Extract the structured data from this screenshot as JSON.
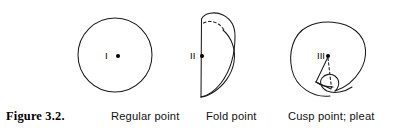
{
  "figure": {
    "number_label": "Figure 3.2.",
    "background": "#ffffff",
    "ink": "#111111"
  },
  "panels": [
    {
      "id": "regular-point",
      "caption": "Regular point",
      "point_label": "I",
      "shape": "circle",
      "marker": "dot"
    },
    {
      "id": "fold-point",
      "caption": "Fold point",
      "point_label": "II",
      "shape": "fold",
      "marker": "dot",
      "hidden_edge": "dashed-arc"
    },
    {
      "id": "cusp-point",
      "caption": "Cusp point; pleat",
      "point_label": "III",
      "shape": "cusp-pleat",
      "marker": "dot",
      "hidden_edge": "dashed-line"
    }
  ]
}
